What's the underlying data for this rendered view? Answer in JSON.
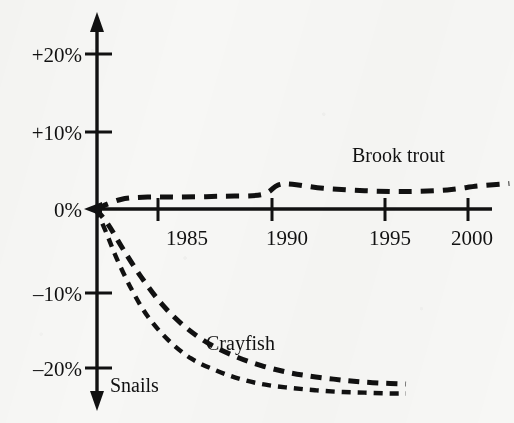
{
  "chart_data": {
    "type": "line",
    "title": "",
    "subtitle": "",
    "xlabel": "",
    "ylabel": "",
    "xlim": [
      1982,
      2002
    ],
    "ylim": [
      -25,
      22
    ],
    "grid": false,
    "legend": "inline-labels",
    "x_ticks": [
      1985,
      1990,
      1995,
      2000
    ],
    "x_tick_labels": [
      "1985",
      "1990",
      "1995",
      "2000"
    ],
    "y_ticks": [
      20,
      10,
      0,
      -10,
      -20
    ],
    "y_tick_labels": [
      "+20%",
      "+10%",
      "0%",
      "–10%",
      "–20%"
    ],
    "series": [
      {
        "name": "Brook trout",
        "label": "Brook trout",
        "dash": "dashed",
        "x": [
          1982.0,
          1983.2,
          1984.5,
          1986.0,
          1988.0,
          1990.0,
          1990.8,
          1991.5,
          1993.0,
          1995.0,
          1997.0,
          1999.0,
          2000.5,
          2002.0
        ],
        "values": [
          0.0,
          1.2,
          1.5,
          1.5,
          1.6,
          1.8,
          3.0,
          3.1,
          2.6,
          2.3,
          2.2,
          2.4,
          2.9,
          3.2
        ]
      },
      {
        "name": "Crayfish",
        "label": "Crayfish",
        "dash": "dashed",
        "x": [
          1982.0,
          1982.6,
          1983.3,
          1984.2,
          1985.2,
          1986.3,
          1987.5,
          1988.8,
          1990.0,
          1991.2,
          1992.3,
          1993.5,
          1994.6,
          1995.8,
          1997.0
        ],
        "values": [
          0.0,
          -2.0,
          -5.0,
          -8.6,
          -12.0,
          -14.8,
          -17.0,
          -18.6,
          -19.7,
          -20.5,
          -21.0,
          -21.4,
          -21.7,
          -21.9,
          -22.0
        ]
      },
      {
        "name": "Snails",
        "label": "Snails",
        "dash": "dashed",
        "x": [
          1982.0,
          1982.5,
          1983.0,
          1983.7,
          1984.5,
          1985.5,
          1986.6,
          1987.8,
          1989.0,
          1990.2,
          1991.4,
          1992.6,
          1993.8,
          1995.0,
          1996.2,
          1997.0
        ],
        "values": [
          0.0,
          -3.0,
          -6.2,
          -10.0,
          -13.5,
          -16.5,
          -18.8,
          -20.3,
          -21.4,
          -22.1,
          -22.5,
          -22.8,
          -23.0,
          -23.1,
          -23.2,
          -23.2
        ]
      }
    ]
  },
  "axis": {
    "y_arrow_up": true,
    "y_arrow_down": true,
    "x_arrow_left": true
  },
  "colors": {
    "ink": "#111111",
    "paper": "#f7f7f5"
  }
}
